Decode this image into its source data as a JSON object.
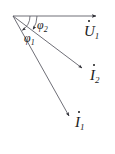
{
  "figure": {
    "width": 115,
    "height": 154,
    "background": "#ffffff",
    "stroke_color": "#4a4a52",
    "text_color": "#1a1a1a",
    "origin": {
      "x": 13,
      "y": 16
    }
  },
  "vectors": [
    {
      "id": "U1",
      "symbol": "U",
      "subscript": "1",
      "label": "U̇₁",
      "overdot": true,
      "angle_deg": 0,
      "length_px": 84,
      "tip": {
        "x": 97,
        "y": 16
      },
      "label_pos": {
        "x": 84,
        "y": 23
      }
    },
    {
      "id": "I2",
      "symbol": "I",
      "subscript": "2",
      "label": "İ₂",
      "overdot": true,
      "angle_deg": -34,
      "length_px": 85,
      "tip": {
        "x": 83,
        "y": 69
      },
      "label_pos": {
        "x": 90,
        "y": 67
      }
    },
    {
      "id": "I1",
      "symbol": "I",
      "subscript": "1",
      "label": "İ₁",
      "overdot": true,
      "angle_deg": -57,
      "length_px": 118,
      "tip": {
        "x": 70,
        "y": 117
      },
      "label_pos": {
        "x": 75,
        "y": 114
      }
    }
  ],
  "angles": [
    {
      "id": "phi2",
      "symbol": "φ",
      "subscript": "2",
      "label": "φ₂",
      "between": [
        "U1",
        "I2"
      ],
      "value_deg": 34,
      "arc_radius_px": 24,
      "label_pos": {
        "x": 37,
        "y": 16
      }
    },
    {
      "id": "phi1",
      "symbol": "φ",
      "subscript": "1",
      "label": "φ₁",
      "between": [
        "U1",
        "I1"
      ],
      "value_deg": 57,
      "arc_radius_px": 17,
      "label_pos": {
        "x": 24,
        "y": 29
      }
    }
  ]
}
